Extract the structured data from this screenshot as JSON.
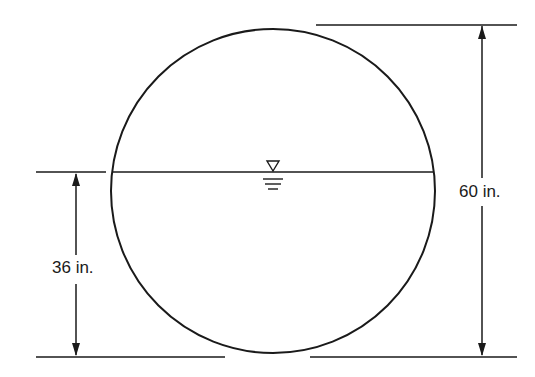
{
  "diagram": {
    "type": "pipe-cross-section",
    "shape": "circle",
    "stroke_color": "#1a1a1a",
    "background": "#ffffff",
    "water_surface_symbol": "inverted-triangle-with-dashes",
    "dimensions": {
      "diameter_label": "60 in.",
      "depth_label": "36 in."
    }
  }
}
